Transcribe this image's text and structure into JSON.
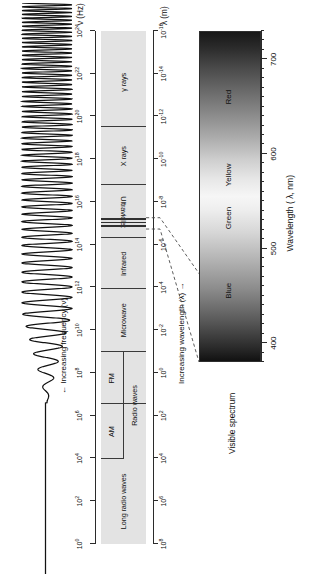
{
  "figure": {
    "type": "electromagnetic-spectrum-diagram",
    "orientation": "rotated-90-ccw",
    "background": "#ffffff",
    "bar_color": "#e3e3e3",
    "line_color": "#3a3a3a"
  },
  "frequency_axis": {
    "name": "ν (Hz)",
    "caption": "Increasing frequency (ν)",
    "arrow": "←",
    "unit": "Hz",
    "tick_labels": [
      "10⁰",
      "10²",
      "10⁴",
      "10⁶",
      "10⁸",
      "10¹⁰",
      "10¹²",
      "10¹⁴",
      "10¹⁶",
      "10¹⁸",
      "10²⁰",
      "10²²",
      "10²⁴"
    ],
    "ticks": [
      {
        "mantissa": "10",
        "exp": "0"
      },
      {
        "mantissa": "10",
        "exp": "2"
      },
      {
        "mantissa": "10",
        "exp": "4"
      },
      {
        "mantissa": "10",
        "exp": "6"
      },
      {
        "mantissa": "10",
        "exp": "8"
      },
      {
        "mantissa": "10",
        "exp": "10"
      },
      {
        "mantissa": "10",
        "exp": "12"
      },
      {
        "mantissa": "10",
        "exp": "14"
      },
      {
        "mantissa": "10",
        "exp": "16"
      },
      {
        "mantissa": "10",
        "exp": "18"
      },
      {
        "mantissa": "10",
        "exp": "20"
      },
      {
        "mantissa": "10",
        "exp": "22"
      },
      {
        "mantissa": "10",
        "exp": "24"
      }
    ]
  },
  "wavelength_axis": {
    "name": "λ (m)",
    "caption": "Increasing wavelength (λ)",
    "arrow": "→",
    "unit": "m",
    "tick_labels": [
      "10⁸",
      "10⁶",
      "10⁴",
      "10²",
      "10⁰",
      "10⁻²",
      "10⁻⁴",
      "10⁻⁶",
      "10⁻⁸",
      "10⁻¹⁰",
      "10⁻¹²",
      "10⁻¹⁴",
      "10⁻¹⁶"
    ],
    "ticks": [
      {
        "mantissa": "10",
        "exp": "8"
      },
      {
        "mantissa": "10",
        "exp": "6"
      },
      {
        "mantissa": "10",
        "exp": "4"
      },
      {
        "mantissa": "10",
        "exp": "2"
      },
      {
        "mantissa": "10",
        "exp": "0"
      },
      {
        "mantissa": "10",
        "exp": "-2"
      },
      {
        "mantissa": "10",
        "exp": "-4"
      },
      {
        "mantissa": "10",
        "exp": "-6"
      },
      {
        "mantissa": "10",
        "exp": "-8"
      },
      {
        "mantissa": "10",
        "exp": "-10"
      },
      {
        "mantissa": "10",
        "exp": "-12"
      },
      {
        "mantissa": "10",
        "exp": "-14"
      },
      {
        "mantissa": "10",
        "exp": "-16"
      }
    ]
  },
  "bands": [
    {
      "label": "Long radio waves",
      "flip": false
    },
    {
      "label": "AM",
      "flip": false
    },
    {
      "label": "FM",
      "flip": false
    },
    {
      "label": "Radio waves",
      "flip": false
    },
    {
      "label": "Microwave",
      "flip": false
    },
    {
      "label": "Infrared",
      "flip": false
    },
    {
      "label": "Ultraviolet",
      "flip": true
    },
    {
      "label": "X rays",
      "flip": false
    },
    {
      "label": "γ rays",
      "flip": false
    }
  ],
  "inset": {
    "title": "Visible spectrum",
    "colors": [
      "Blue",
      "Green",
      "Yellow",
      "Red"
    ],
    "axis_name": "Wavelength ( λ, nm)",
    "axis_ticks": [
      "400",
      "500",
      "600",
      "700"
    ],
    "axis_range": [
      380,
      730
    ]
  },
  "chart_data": {
    "type": "bar",
    "xlabel": "Increasing frequency (ν)",
    "ylabel": "Increasing wavelength (λ)",
    "categories": [
      "Long radio waves",
      "AM",
      "FM",
      "Radio waves",
      "Microwave",
      "Infrared",
      "Visible",
      "Ultraviolet",
      "X rays",
      "γ rays"
    ],
    "frequency_hz_log10_ranges": [
      [
        -1,
        5.6
      ],
      [
        5.6,
        7.1
      ],
      [
        7.1,
        8.3
      ],
      [
        5.6,
        8.9
      ],
      [
        8.9,
        12.3
      ],
      [
        12.3,
        14.6
      ],
      [
        14.6,
        14.9
      ],
      [
        14.9,
        17.0
      ],
      [
        17.0,
        20.4
      ],
      [
        20.4,
        25
      ]
    ],
    "wavelength_m_log10_ranges": [
      [
        9.5,
        2.7
      ],
      [
        2.7,
        1.2
      ],
      [
        1.2,
        0.0
      ],
      [
        2.7,
        -0.6
      ],
      [
        -0.6,
        -4.0
      ],
      [
        -4.0,
        -6.3
      ],
      [
        -6.3,
        -6.6
      ],
      [
        -6.6,
        -8.7
      ],
      [
        -8.7,
        -12.1
      ],
      [
        -12.1,
        -16.7
      ]
    ],
    "visible_nm": {
      "min": 400,
      "max": 700
    },
    "visible_bands_nm": [
      {
        "name": "Blue",
        "center": 460
      },
      {
        "name": "Green",
        "center": 530
      },
      {
        "name": "Yellow",
        "center": 580
      },
      {
        "name": "Red",
        "center": 660
      }
    ],
    "grid": false,
    "legend": "none"
  }
}
